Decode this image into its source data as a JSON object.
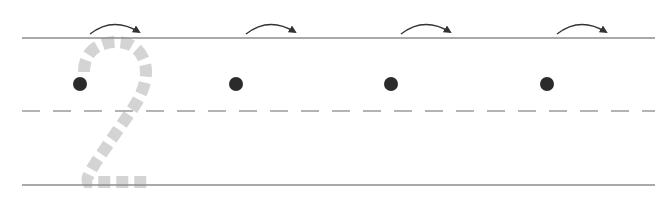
{
  "worksheet": {
    "title": "Number 2 tracing practice",
    "digit": "2",
    "colors": {
      "background": "#ffffff",
      "line": "#8c8c8c",
      "dashed_line": "#9a9a9a",
      "trace_digit": "#d4d4d4",
      "dot": "#2b2b2b",
      "arrow": "#333333"
    },
    "guide_lines": {
      "top_y": 38,
      "mid_y": 111,
      "bottom_y": 185,
      "x_start": 22,
      "x_end": 655
    },
    "start_points": [
      {
        "x": 80,
        "y": 84,
        "arrow": "arrow-right"
      },
      {
        "x": 236,
        "y": 84,
        "arrow": "arrow-right"
      },
      {
        "x": 391,
        "y": 84,
        "arrow": "arrow-right"
      },
      {
        "x": 547,
        "y": 84,
        "arrow": "arrow-right"
      }
    ]
  }
}
